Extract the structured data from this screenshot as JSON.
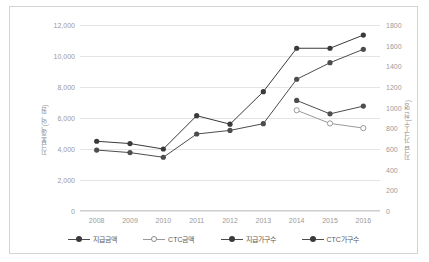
{
  "chart_data": {
    "type": "line",
    "title": "",
    "xlabel": "",
    "ylabel": "지급총액(억 원)",
    "ylabel_right": "지급 가구수(천 명)",
    "categories": [
      "2008",
      "2009",
      "2010",
      "2011",
      "2012",
      "2013",
      "2014",
      "2015",
      "2016"
    ],
    "ylim": [
      0,
      12000
    ],
    "yticks": [
      "0",
      "2,000",
      "4,000",
      "6,000",
      "8,000",
      "10,000",
      "12,000"
    ],
    "ylim_right": [
      0,
      1800
    ],
    "yticks_right": [
      "0",
      "200",
      "400",
      "600",
      "800",
      "1000",
      "1200",
      "1400",
      "1600",
      "1800"
    ],
    "grid": true,
    "legend_position": "bottom",
    "series": [
      {
        "name": "지급금액",
        "axis": "left",
        "marker": "filled-circle",
        "color": "#3a3a3a",
        "values": [
          4500,
          4350,
          4000,
          6150,
          5600,
          7700,
          10500,
          10500,
          11350
        ]
      },
      {
        "name": "CTC금액",
        "axis": "left",
        "marker": "hollow-circle",
        "color": "#9a9a9a",
        "values": [
          null,
          null,
          null,
          null,
          null,
          null,
          6500,
          5650,
          5350
        ]
      },
      {
        "name": "지급가구수",
        "axis": "right",
        "marker": "filled-circle",
        "color": "#4d4d4d",
        "values": [
          590,
          565,
          520,
          745,
          780,
          845,
          1275,
          1435,
          1565
        ]
      },
      {
        "name": "CTC가구수",
        "axis": "right",
        "marker": "filled-circle",
        "color": "#4d4d4d",
        "values": [
          null,
          null,
          null,
          null,
          null,
          null,
          1070,
          940,
          1015
        ]
      }
    ]
  }
}
